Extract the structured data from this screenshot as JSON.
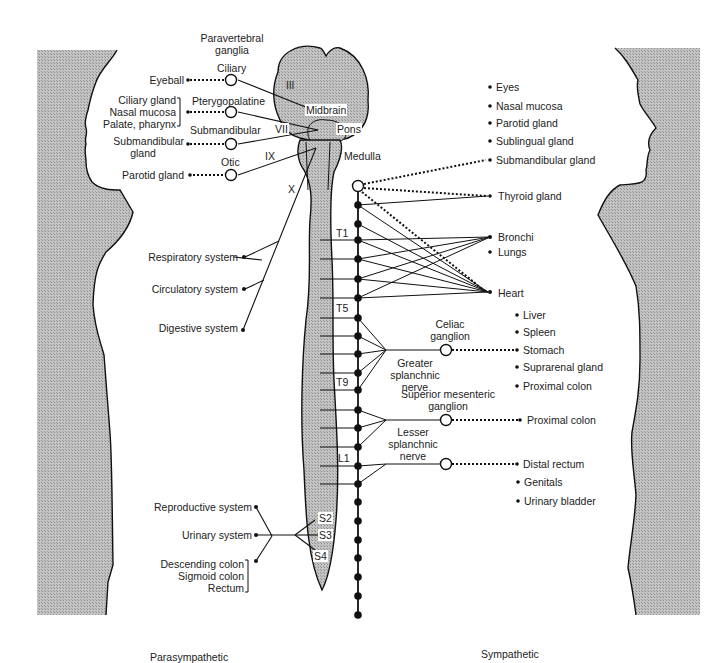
{
  "figure": {
    "type": "autonomic-nervous-system-diagram",
    "captions": {
      "left": "Parasympathetic",
      "right": "Sympathetic"
    },
    "header": {
      "ganglia_title_line1": "Paravertebral",
      "ganglia_title_line2": "ganglia"
    },
    "colors": {
      "fill_gray": "#c9c9c9",
      "stroke": "#111111",
      "background": "#ffffff"
    }
  },
  "brain": {
    "regions": [
      "Midbrain",
      "Pons",
      "Medulla"
    ],
    "cranial_nerves": [
      "III",
      "VII",
      "IX",
      "X"
    ]
  },
  "parasympathetic": {
    "cranial_ganglia": [
      {
        "ganglion": "Ciliary",
        "targets": [
          "Eyeball"
        ]
      },
      {
        "ganglion": "Pterygopalatine",
        "targets": [
          "Ciliary gland",
          "Nasal mucosa",
          "Palate, pharynx"
        ]
      },
      {
        "ganglion": "Submandibular",
        "targets": [
          "Submandibular",
          "gland"
        ]
      },
      {
        "ganglion": "Otic",
        "targets": [
          "Parotid gland"
        ]
      }
    ],
    "vagus_targets": [
      "Respiratory system",
      "Circulatory system",
      "Digestive system"
    ],
    "sacral_levels": [
      "S2",
      "S3",
      "S4"
    ],
    "sacral_targets": [
      "Reproductive system",
      "Urinary system"
    ],
    "sacral_bracket_targets": [
      "Descending colon",
      "Sigmoid colon",
      "Rectum"
    ]
  },
  "sympathetic": {
    "spinal_levels": [
      "T1",
      "T5",
      "T9",
      "L1"
    ],
    "head_targets": [
      "Eyes",
      "Nasal mucosa",
      "Parotid gland",
      "Sublingual gland",
      "Submandibular gland"
    ],
    "thoracic_targets": [
      "Thyroid gland",
      "Bronchi",
      "Lungs",
      "Heart"
    ],
    "celiac": {
      "name_line1": "Celiac",
      "name_line2": "ganglion",
      "nerve_line1": "Greater",
      "nerve_line2": "splanchnic",
      "nerve_line3": "nerve",
      "targets": [
        "Liver",
        "Spleen",
        "Stomach",
        "Suprarenal gland",
        "Proximal colon"
      ]
    },
    "superior_mesenteric": {
      "name_line1": "Superior mesenteric",
      "name_line2": "ganglion",
      "nerve_line1": "Lesser",
      "nerve_line2": "splanchnic",
      "nerve_line3": "nerve",
      "targets": [
        "Proximal colon"
      ]
    },
    "inferior": {
      "targets": [
        "Distal rectum",
        "Genitals",
        "Urinary bladder"
      ]
    }
  }
}
